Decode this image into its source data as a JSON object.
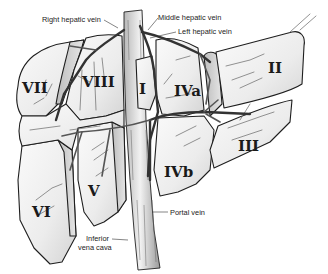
{
  "figure": {
    "colors": {
      "outline": "#1e1e1e",
      "lobe_fill_light": "#f4f4f4",
      "lobe_fill_shadow": "#cfcfcf",
      "vessel": "#555555",
      "label": "#1a1a1a"
    }
  },
  "segments": [
    {
      "id": "VII",
      "label": "VII"
    },
    {
      "id": "VIII",
      "label": "VIII"
    },
    {
      "id": "I",
      "label": "I"
    },
    {
      "id": "IVa",
      "label": "IVa"
    },
    {
      "id": "II",
      "label": "II"
    },
    {
      "id": "III",
      "label": "III"
    },
    {
      "id": "IVb",
      "label": "IVb"
    },
    {
      "id": "V",
      "label": "V"
    },
    {
      "id": "VI",
      "label": "VI"
    }
  ],
  "callouts": {
    "right_hepatic_vein": "Right hepatic vein",
    "middle_hepatic_vein": "Middle hepatic vein",
    "left_hepatic_vein": "Left hepatic vein",
    "portal_vein": "Portal vein",
    "inferior_vena_cava_line1": "Inferior",
    "inferior_vena_cava_line2": "vena cava"
  }
}
